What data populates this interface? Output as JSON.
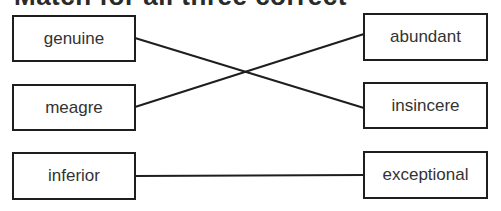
{
  "title": "Match for all three correct",
  "left_items": [
    {
      "label": "genuine"
    },
    {
      "label": "meagre"
    },
    {
      "label": "inferior"
    }
  ],
  "right_items": [
    {
      "label": "abundant"
    },
    {
      "label": "insincere"
    },
    {
      "label": "exceptional"
    }
  ],
  "connections": [
    {
      "from": "genuine",
      "to": "insincere"
    },
    {
      "from": "meagre",
      "to": "abundant"
    },
    {
      "from": "inferior",
      "to": "exceptional"
    }
  ],
  "colors": {
    "line": "#1e1e1e",
    "text": "#333333",
    "border": "#1e1e1e"
  }
}
